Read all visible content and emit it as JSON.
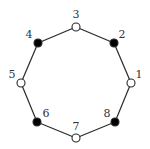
{
  "diagram": {
    "type": "cycle-graph",
    "nodes": [
      {
        "id": "1",
        "label": "1",
        "x": 131,
        "y": 83,
        "filled": false,
        "lx": 139,
        "ly": 78
      },
      {
        "id": "2",
        "label": "2",
        "x": 114,
        "y": 43,
        "filled": true,
        "lx": 122,
        "ly": 38
      },
      {
        "id": "3",
        "label": "3",
        "x": 76,
        "y": 27,
        "filled": false,
        "lx": 76,
        "ly": 18
      },
      {
        "id": "4",
        "label": "4",
        "x": 38,
        "y": 43,
        "filled": true,
        "lx": 29,
        "ly": 38
      },
      {
        "id": "5",
        "label": "5",
        "x": 21,
        "y": 83,
        "filled": false,
        "lx": 12,
        "ly": 78
      },
      {
        "id": "6",
        "label": "6",
        "x": 37,
        "y": 122,
        "filled": true,
        "lx": 46,
        "ly": 117
      },
      {
        "id": "7",
        "label": "7",
        "x": 76,
        "y": 138,
        "filled": false,
        "lx": 76,
        "ly": 130
      },
      {
        "id": "8",
        "label": "8",
        "x": 115,
        "y": 122,
        "filled": true,
        "lx": 107,
        "ly": 117
      }
    ],
    "edges": [
      [
        "1",
        "2"
      ],
      [
        "2",
        "3"
      ],
      [
        "3",
        "4"
      ],
      [
        "4",
        "5"
      ],
      [
        "5",
        "6"
      ],
      [
        "6",
        "7"
      ],
      [
        "7",
        "8"
      ],
      [
        "8",
        "1"
      ]
    ],
    "colors": {
      "filled": "#000000",
      "hollow": "#ffffff",
      "stroke": "#2a2a2a"
    }
  }
}
